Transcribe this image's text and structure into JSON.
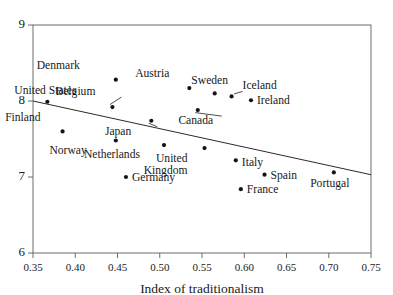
{
  "chart_data": {
    "type": "scatter",
    "title": "",
    "xlabel": "Index of traditionalism",
    "ylabel": "",
    "xlim": [
      0.35,
      0.75
    ],
    "ylim": [
      6,
      9
    ],
    "xticks": [
      "0.35",
      "0.40",
      "0.45",
      "0.50",
      "0.55",
      "0.60",
      "0.65",
      "0.70",
      "0.75"
    ],
    "xtick_values": [
      0.35,
      0.4,
      0.45,
      0.5,
      0.55,
      0.6,
      0.65,
      0.7,
      0.75
    ],
    "yticks": [
      "6",
      "7",
      "8",
      "9"
    ],
    "ytick_values": [
      6,
      7,
      8,
      9
    ],
    "grid": false,
    "legend": "none",
    "points": [
      {
        "label": "Denmark",
        "x": 0.448,
        "y": 8.28,
        "label_dx": -36,
        "label_dy": -11,
        "leader": false
      },
      {
        "label": "United States",
        "x": 0.367,
        "y": 7.99,
        "label_dx": -2,
        "label_dy": -8,
        "leader": false
      },
      {
        "label": "Austria",
        "x": 0.535,
        "y": 8.17,
        "label_dx": -20,
        "label_dy": -11,
        "leader": false
      },
      {
        "label": "Sweden",
        "x": 0.565,
        "y": 8.1,
        "label_dx": -5,
        "label_dy": -9,
        "leader": false
      },
      {
        "label": "Iceland",
        "x": 0.585,
        "y": 8.06,
        "label_dx": 11,
        "label_dy": -7,
        "leader": true
      },
      {
        "label": "Ireland",
        "x": 0.608,
        "y": 8.01,
        "label_dx": 6,
        "label_dy": 4,
        "leader": false
      },
      {
        "label": "Belgium",
        "x": 0.444,
        "y": 7.92,
        "label_dx": -17,
        "label_dy": -12,
        "leader": true
      },
      {
        "label": "Canada",
        "x": 0.545,
        "y": 7.88,
        "label_dx": -2,
        "label_dy": 14,
        "leader": true
      },
      {
        "label": "Finland",
        "x": 0.385,
        "y": 7.6,
        "label_dx": -22,
        "label_dy": -10,
        "leader": false
      },
      {
        "label": "Japan",
        "x": 0.49,
        "y": 7.74,
        "label_dx": -20,
        "label_dy": 14,
        "leader": true
      },
      {
        "label": "Norway",
        "x": 0.448,
        "y": 7.48,
        "label_dx": -29,
        "label_dy": 13,
        "leader": false
      },
      {
        "label": "Netherlands",
        "x": 0.505,
        "y": 7.42,
        "label_dx": -24,
        "label_dy": 13,
        "leader": false
      },
      {
        "label": "United Kingdom",
        "x": 0.553,
        "y": 7.38,
        "label_dx": -17,
        "label_dy": 14,
        "leader": false
      },
      {
        "label": "Italy",
        "x": 0.59,
        "y": 7.22,
        "label_dx": 6,
        "label_dy": 6,
        "leader": false
      },
      {
        "label": "Germany",
        "x": 0.46,
        "y": 7.0,
        "label_dx": 6,
        "label_dy": 4,
        "leader": false
      },
      {
        "label": "Spain",
        "x": 0.624,
        "y": 7.03,
        "label_dx": 6,
        "label_dy": 4,
        "leader": false
      },
      {
        "label": "Portugal",
        "x": 0.706,
        "y": 7.06,
        "label_dx": -4,
        "label_dy": 15,
        "leader": false
      },
      {
        "label": "France",
        "x": 0.596,
        "y": 6.84,
        "label_dx": 6,
        "label_dy": 4,
        "leader": false
      }
    ],
    "trendline": {
      "x_start": 0.35,
      "y_start": 8.0,
      "x_end": 0.75,
      "y_end": 7.03
    },
    "colors": {
      "point": "#151515",
      "trendline": "#2b2b2b",
      "axis": "#6d6d6d",
      "text": "#1a1a1a",
      "background": "#ffffff"
    }
  }
}
